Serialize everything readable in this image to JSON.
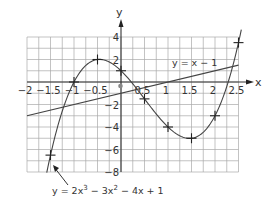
{
  "chart_data": {
    "type": "line",
    "title": "",
    "xlabel": "x",
    "ylabel": "y",
    "xlim": [
      -2,
      2.5
    ],
    "ylim": [
      -8,
      4
    ],
    "grid": true,
    "x_ticks": [
      "-2",
      "-1.5",
      "-1",
      "-0.5",
      "0",
      "0.5",
      "1",
      "1.5",
      "2",
      "2.5"
    ],
    "y_ticks": [
      "4",
      "2",
      "-2",
      "-4",
      "-6",
      "-8"
    ],
    "series": [
      {
        "name": "y = 2x³ − 3x² − 4x + 1",
        "label": "y = 2x",
        "label_exp1": "3",
        "label_mid": " − 3x",
        "label_exp2": "2",
        "label_end": " − 4x + 1",
        "x": [
          -1.5,
          -1,
          -0.5,
          0,
          0.5,
          1,
          1.5,
          2,
          2.5
        ],
        "y": [
          -6.5,
          0,
          2,
          1,
          -1.5,
          -4,
          -5,
          -3,
          3.5
        ],
        "plotted_points_marked": true
      },
      {
        "name": "y = x − 1",
        "label": "y = x − 1",
        "x": [
          -2,
          2.5
        ],
        "y": [
          -3,
          1.5
        ]
      }
    ],
    "annotations": [
      {
        "text": "y = 2x³ − 3x² − 4x + 1",
        "arrow_to": [
          -1.4,
          -7.5
        ]
      },
      {
        "text": "y = x − 1",
        "position": [
          1.25,
          1.8
        ]
      }
    ]
  },
  "labels": {
    "x_axis": "x",
    "y_axis": "y",
    "line_label": "y = x − 1"
  }
}
